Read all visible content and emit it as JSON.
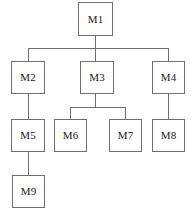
{
  "diagram": {
    "type": "tree",
    "canvas": {
      "width": 191,
      "height": 218,
      "background": "#ffffff"
    },
    "style": {
      "box_border_color": "#6f6f6f",
      "box_fill_color": "#ffffff",
      "line_color": "#6f6f6f",
      "text_color": "#1a1a1a"
    },
    "nodes": [
      {
        "id": "M1",
        "label": "M1",
        "level": 0,
        "x": 78,
        "y": 2,
        "w": 35,
        "h": 34
      },
      {
        "id": "M2",
        "label": "M2",
        "level": 1,
        "x": 11,
        "y": 61,
        "w": 34,
        "h": 33
      },
      {
        "id": "M3",
        "label": "M3",
        "level": 1,
        "x": 80,
        "y": 61,
        "w": 34,
        "h": 33
      },
      {
        "id": "M4",
        "label": "M4",
        "level": 1,
        "x": 152,
        "y": 61,
        "w": 33,
        "h": 33
      },
      {
        "id": "M5",
        "label": "M5",
        "level": 2,
        "x": 11,
        "y": 119,
        "w": 34,
        "h": 33
      },
      {
        "id": "M6",
        "label": "M6",
        "level": 2,
        "x": 54,
        "y": 119,
        "w": 33,
        "h": 33
      },
      {
        "id": "M7",
        "label": "M7",
        "level": 2,
        "x": 109,
        "y": 119,
        "w": 33,
        "h": 33
      },
      {
        "id": "M8",
        "label": "M8",
        "level": 2,
        "x": 152,
        "y": 119,
        "w": 33,
        "h": 33
      },
      {
        "id": "M9",
        "label": "M9",
        "level": 3,
        "x": 12,
        "y": 175,
        "w": 33,
        "h": 33
      }
    ],
    "edges": [
      {
        "from": "M1",
        "to": "M2"
      },
      {
        "from": "M1",
        "to": "M3"
      },
      {
        "from": "M1",
        "to": "M4"
      },
      {
        "from": "M2",
        "to": "M5"
      },
      {
        "from": "M3",
        "to": "M6"
      },
      {
        "from": "M3",
        "to": "M7"
      },
      {
        "from": "M4",
        "to": "M8"
      },
      {
        "from": "M5",
        "to": "M9"
      }
    ],
    "connector_geometry": {
      "m1_bus_y": 48,
      "m1_bus_x_start": 28,
      "m1_bus_x_end": 168,
      "m3_bus_y": 107,
      "m3_bus_x_start": 70,
      "m3_bus_x_end": 126
    }
  }
}
